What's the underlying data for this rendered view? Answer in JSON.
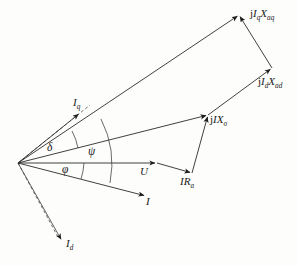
{
  "figure": {
    "kind": "phasor-diagram",
    "background_color": "#fdfdfc",
    "line_color": "#2b2b2b"
  },
  "labels": {
    "jIqXaq": {
      "base": "j",
      "var1": "I",
      "sub1": "q",
      "var2": "X",
      "sub2": "aq",
      "text": "jIqXaq"
    },
    "jIdXad": {
      "base": "j",
      "var1": "I",
      "sub1": "d",
      "var2": "X",
      "sub2": "ad",
      "text": "jIdXad"
    },
    "jIXsigma": {
      "base": "j",
      "var1": "I",
      "var2": "X",
      "sub2": "σ",
      "text": "jIXσ"
    },
    "IRa": {
      "var1": "I",
      "var2": "R",
      "sub2": "a",
      "text": "IRa"
    },
    "U": {
      "text": "U"
    },
    "I": {
      "text": "I"
    },
    "Iq": {
      "var1": "I",
      "sub1": "q",
      "text": "Iq"
    },
    "Id": {
      "var1": "I",
      "sub1": "d",
      "text": "Id"
    },
    "delta": {
      "text": "δ"
    },
    "psi": {
      "text": "ψ"
    },
    "phi": {
      "text": "φ"
    }
  },
  "geometry": {
    "origin": {
      "x": 18,
      "y": 163
    },
    "vertices": {
      "top_right": {
        "x": 239,
        "y": 15
      },
      "right": {
        "x": 272,
        "y": 68
      },
      "jix_sigma": {
        "x": 208,
        "y": 115
      },
      "ira_end": {
        "x": 192,
        "y": 173
      },
      "u_end": {
        "x": 157,
        "y": 163
      },
      "i_end": {
        "x": 146,
        "y": 196
      },
      "iq_arrow": {
        "x": 80,
        "y": 113
      },
      "id_arrow": {
        "x": 62,
        "y": 241
      }
    },
    "angles": {
      "delta_deg": 19,
      "psi_deg": 34,
      "phi_deg": 14
    }
  }
}
